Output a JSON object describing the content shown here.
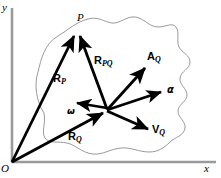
{
  "figure": {
    "type": "vector-diagram",
    "background_color": "#ffffff",
    "ink_color": "#000000",
    "axis_color": "#9a9a9a",
    "body_outline_color": "#8d8d8d"
  },
  "axes": {
    "y_label": "y",
    "x_label": "x",
    "origin_label": "O",
    "origin_point": [
      12,
      162
    ],
    "y_axis_top": [
      12,
      6
    ],
    "x_axis_right": [
      215,
      162
    ],
    "y_label_pos": [
      3,
      4
    ],
    "x_label_pos": [
      204,
      163
    ],
    "origin_label_pos": [
      2,
      164
    ]
  },
  "points": {
    "P": {
      "label": "P",
      "pos": [
        75,
        30
      ],
      "label_pos": [
        77,
        13
      ]
    },
    "Q": {
      "label": "Q",
      "pos": [
        107,
        110
      ]
    }
  },
  "vectors": [
    {
      "name": "R_P",
      "label": "R",
      "subscript": "P",
      "from": [
        12,
        162
      ],
      "to": [
        75,
        32
      ],
      "label_pos": [
        54,
        74
      ],
      "style": "bold-solid",
      "quantity": "position vector of point P from origin"
    },
    {
      "name": "R_Q",
      "label": "R",
      "subscript": "Q",
      "from": [
        12,
        162
      ],
      "to": [
        105,
        112
      ],
      "label_pos": [
        69,
        132
      ],
      "style": "bold-solid",
      "quantity": "position vector of point Q from origin"
    },
    {
      "name": "R_PQ",
      "label": "R",
      "subscript": "PQ",
      "from": [
        107,
        109
      ],
      "to": [
        79,
        32
      ],
      "label_pos": [
        95,
        56
      ],
      "style": "bold-solid",
      "quantity": "relative position vector of P with respect to Q"
    },
    {
      "name": "omega",
      "label": "ω",
      "subscript": "",
      "from": [
        107,
        108
      ],
      "to": [
        74,
        103
      ],
      "label_pos": [
        68,
        107
      ],
      "style": "bold-solid",
      "quantity": "angular velocity vector"
    },
    {
      "name": "alpha",
      "label": "α",
      "subscript": "",
      "from": [
        107,
        110
      ],
      "to": [
        164,
        91
      ],
      "label_pos": [
        167,
        85
      ],
      "style": "bold-solid",
      "quantity": "angular acceleration vector"
    },
    {
      "name": "A_Q",
      "label": "A",
      "subscript": "Q",
      "from": [
        107,
        110
      ],
      "to": [
        147,
        66
      ],
      "label_pos": [
        148,
        52
      ],
      "style": "bold-solid",
      "quantity": "acceleration vector of point Q"
    },
    {
      "name": "V_Q",
      "label": "V",
      "subscript": "Q",
      "from": [
        107,
        111
      ],
      "to": [
        151,
        131
      ],
      "label_pos": [
        153,
        125
      ],
      "style": "bold-solid",
      "quantity": "velocity vector of point Q"
    }
  ],
  "body_outline": {
    "name": "rigid-body-outline",
    "description": "irregular closed blob representing the rigid body",
    "path": "M 44 113 C 36 101 34 84 38 72 C 41 60 44 44 58 36 C 68 30 76 22 88 19 C 98 16 104 22 112 23 C 120 24 126 16 135 17 C 144 18 149 27 158 27 C 166 27 172 22 176 27 C 180 32 176 41 179 47 C 182 53 190 55 190 62 C 190 69 181 71 180 78 C 179 85 187 88 187 95 C 187 102 178 104 178 111 C 178 118 186 121 185 128 C 184 136 175 137 170 142 C 164 148 158 152 149 152 C 139 152 131 147 121 148 C 110 149 103 155 93 154 C 82 153 76 145 67 143 C 58 141 49 144 45 138 C 41 132 46 124 44 113 Z"
  }
}
